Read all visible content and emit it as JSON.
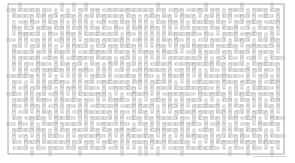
{
  "maze": {
    "type": "rectangular-maze",
    "origin_x": 8,
    "origin_y": 4,
    "cols": 46,
    "rows": 25,
    "cell_size": 6.0,
    "wall_thickness": 2,
    "seed": 9137,
    "colors": {
      "background": "#ffffff",
      "wall_stroke": "#9a9a9a",
      "wall_fill": "#ffffff",
      "border_stroke": "#a8a8a8"
    }
  },
  "footer": {
    "credit_line_color": "#cccccc"
  }
}
